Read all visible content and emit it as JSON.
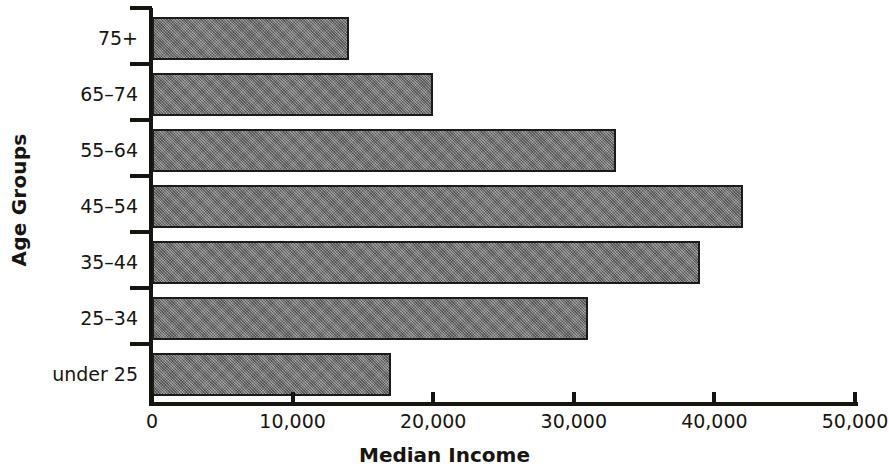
{
  "chart_data": {
    "type": "bar",
    "orientation": "horizontal",
    "title": "",
    "xlabel": "Median Income",
    "ylabel": "Age Groups",
    "categories": [
      "under 25",
      "25–34",
      "35–44",
      "45–54",
      "55–64",
      "65–74",
      "75+"
    ],
    "values": [
      17000,
      31000,
      39000,
      42000,
      33000,
      20000,
      14000
    ],
    "xlim": [
      0,
      50000
    ],
    "xticks": [
      0,
      10000,
      20000,
      30000,
      40000,
      50000
    ],
    "xtick_labels": [
      "0",
      "10,000",
      "20,000",
      "30,000",
      "40,000",
      "50,000"
    ],
    "grid": false,
    "legend": false,
    "bar_fill_color": "#7e7e7e",
    "bar_edge_color": "#1b1b1b",
    "axis_color": "#17150f",
    "background_color": "#ffffff"
  },
  "axes": {
    "y_title": "Age Groups",
    "x_title": "Median Income"
  }
}
